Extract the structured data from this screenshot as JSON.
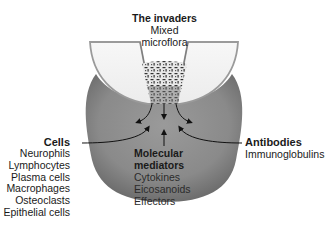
{
  "diagram": {
    "invaders": {
      "title": "The invaders",
      "lines": [
        "Mixed",
        "microflora"
      ]
    },
    "cells": {
      "title": "Cells",
      "items": [
        "Neurophils",
        "Lymphocytes",
        "Plasma cells",
        "Macrophages",
        "Osteoclasts",
        "Epithelial cells"
      ]
    },
    "molecular_mediators": {
      "title_lines": [
        "Molecular",
        "mediators"
      ],
      "items": [
        "Cytokines",
        "Eicosanoids",
        "Effectors"
      ]
    },
    "antibodies": {
      "title": "Antibodies",
      "items": [
        "Immunoglobulins"
      ]
    },
    "colors": {
      "tissue": "#8e8e8e",
      "tissue_dark": "#6f6f6f",
      "tooth": "#f2f2f2",
      "tooth_outline": "#9a9a9a",
      "text": "#1a1a1a"
    }
  }
}
